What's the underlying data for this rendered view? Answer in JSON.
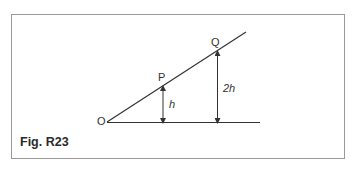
{
  "figure": {
    "caption": "Fig. R23",
    "points": {
      "O": {
        "label": "O"
      },
      "P": {
        "label": "P"
      },
      "Q": {
        "label": "Q"
      }
    },
    "heights": {
      "P": {
        "label": "h"
      },
      "Q": {
        "label": "2h"
      }
    },
    "colors": {
      "line": "#333333",
      "frame": "#9a9a9a"
    }
  }
}
